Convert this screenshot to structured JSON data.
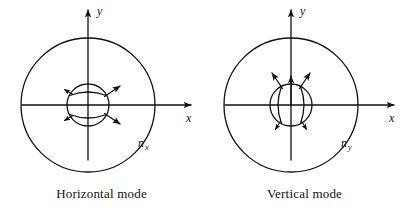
{
  "figure": {
    "background_color": "#ffffff",
    "ink_color": "#111111",
    "width": 407,
    "height": 216
  },
  "panels": [
    {
      "id": "horizontal-mode",
      "caption": "Horizontal mode",
      "index_label": "n",
      "index_subscript": "x",
      "axis_x_label": "x",
      "axis_y_label": "y",
      "mode_orientation": "horizontal",
      "center": {
        "x": 88,
        "y": 105
      },
      "outer_circle_radius": 67,
      "inner_circle_radius": 21,
      "field_line_count": 2,
      "arrow_count": 5,
      "arrow_directions": [
        "up-right",
        "right",
        "down-right",
        "up-left",
        "down-left"
      ]
    },
    {
      "id": "vertical-mode",
      "caption": "Vertical mode",
      "index_label": "n",
      "index_subscript": "y",
      "axis_x_label": "x",
      "axis_y_label": "y",
      "mode_orientation": "vertical",
      "center": {
        "x": 88,
        "y": 105
      },
      "outer_circle_radius": 67,
      "inner_circle_radius": 21,
      "field_line_count": 2,
      "arrow_count": 5,
      "arrow_directions": [
        "up-left",
        "up",
        "up-right",
        "down-left",
        "down-right"
      ]
    }
  ]
}
